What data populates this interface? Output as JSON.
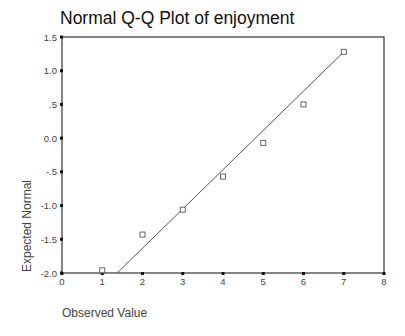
{
  "chart_data": {
    "type": "scatter",
    "title": "Normal Q-Q Plot of enjoyment",
    "xlabel": "Observed Value",
    "ylabel": "Expected Normal",
    "xlim": [
      0,
      8
    ],
    "ylim": [
      -2.0,
      1.5
    ],
    "x_ticks": [
      "0",
      "1",
      "2",
      "3",
      "4",
      "5",
      "6",
      "7",
      "8"
    ],
    "y_ticks": [
      "1.5",
      "1.0",
      ".5",
      "0.0",
      "-.5",
      "-1.0",
      "-1.5",
      "-2.0"
    ],
    "grid": false,
    "legend": null,
    "series": [
      {
        "name": "enjoyment",
        "marker": "open-square",
        "x": [
          1,
          2,
          3,
          4,
          5,
          6,
          7
        ],
        "y": [
          -1.96,
          -1.43,
          -1.06,
          -0.57,
          -0.07,
          0.5,
          1.28
        ]
      }
    ],
    "reference_line": {
      "x": [
        1.37,
        7.0
      ],
      "y": [
        -2.0,
        1.28
      ]
    }
  },
  "colors": {
    "axis": "#333333",
    "marker": "#555555",
    "line": "#555555",
    "text": "#444444"
  }
}
